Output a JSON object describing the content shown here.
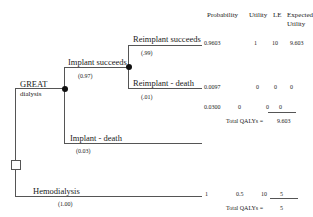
{
  "headers": {
    "probability": "Probability",
    "utility": "Utility",
    "le": "LE",
    "expected_utility_line1": "Expected",
    "expected_utility_line2": "Utility"
  },
  "great": {
    "label_line1": "GREAT",
    "label_line2": "dialysis",
    "branches": [
      {
        "label": "Implant succeeds",
        "prob": "(0.97)"
      },
      {
        "label": "Implant - death",
        "prob": "(0.03)"
      }
    ],
    "sub_branches": [
      {
        "label": "Reimplant succeeds",
        "prob": "(.99)"
      },
      {
        "label": "Reimplant - death",
        "prob": "(.01)"
      }
    ],
    "rows": [
      {
        "probability": "0.9603",
        "utility": "1",
        "le": "10",
        "eu": "9.603"
      },
      {
        "probability": "0.0097",
        "utility": "0",
        "le": "0",
        "eu": "0"
      },
      {
        "probability": "0.0300",
        "utility": "0",
        "le": "0",
        "eu": "0"
      }
    ],
    "total_label": "Total QALYs =",
    "total_value": "9.603"
  },
  "hemodialysis": {
    "label": "Hemodialysis",
    "prob": "(1.00)",
    "row": {
      "probability": "1",
      "utility": "0.5",
      "le": "10",
      "eu": "5"
    },
    "total_label": "Total QALYs =",
    "total_value": "5"
  }
}
